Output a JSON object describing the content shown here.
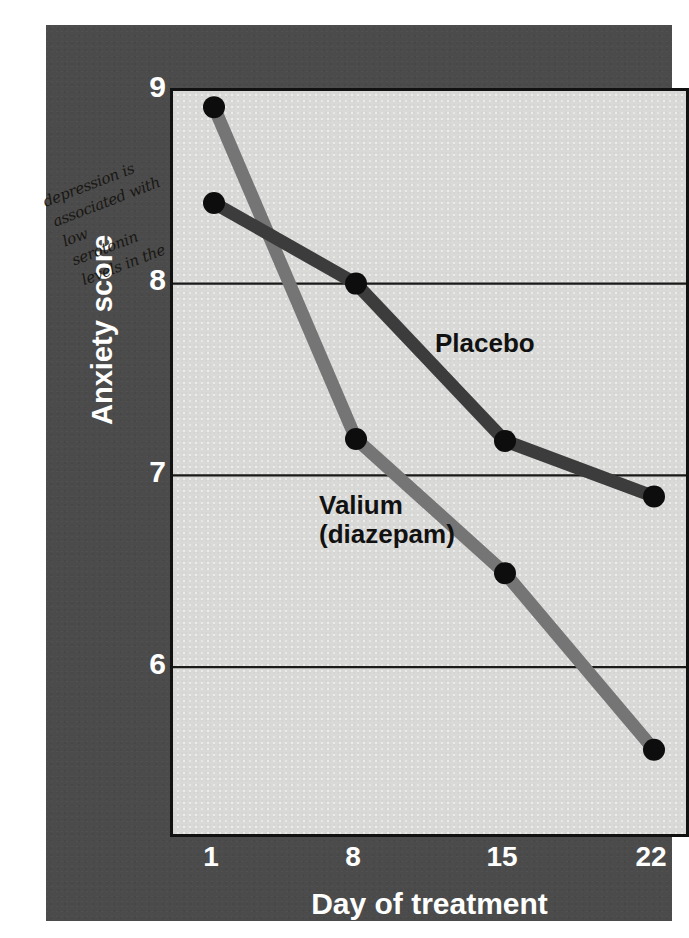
{
  "chart_data": {
    "type": "line",
    "title": "",
    "xlabel": "Day of treatment",
    "ylabel": "Anxiety score",
    "x": [
      1,
      8,
      15,
      22
    ],
    "categories": [
      "1",
      "8",
      "15",
      "22"
    ],
    "xtick_labels": [
      "1",
      "8",
      "15",
      "22"
    ],
    "ytick_labels": [
      "9",
      "8",
      "7",
      "6"
    ],
    "yticks": [
      9,
      8,
      7,
      6
    ],
    "ylim": [
      5.0,
      9.0
    ],
    "xlim": [
      0,
      23
    ],
    "grid": "horizontal",
    "legend_position": "inline-annotations",
    "series": [
      {
        "name": "Placebo",
        "label": "Placebo",
        "color": "#3c3c3c",
        "values": [
          8.42,
          8.0,
          7.18,
          6.89
        ]
      },
      {
        "name": "Valium (diazepam)",
        "label": "Valium\n(diazepam)",
        "color": "#757575",
        "values": [
          8.92,
          7.19,
          6.49,
          5.57
        ]
      }
    ],
    "marker": {
      "shape": "circle",
      "color": "#0d0d0d",
      "radius": 11
    },
    "annotations": [
      {
        "name": "handwritten-margin-note",
        "lines": [
          "depression is",
          "associated with",
          "low",
          "serotonin",
          "levels in the"
        ]
      }
    ]
  },
  "colors": {
    "panel_background": "#4b4b4b",
    "plot_background": "#d9d9d7",
    "plot_border": "#111111",
    "gridline": "#1a1a1a",
    "tick_label": "#ffffff",
    "axis_title": "#ffffff",
    "series_label": "#111111"
  },
  "axes": {
    "y_title": "Anxiety score",
    "x_title": "Day of treatment"
  }
}
